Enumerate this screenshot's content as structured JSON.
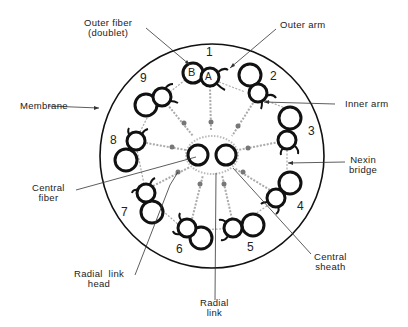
{
  "diagram": {
    "type": "axoneme-cross-section",
    "doublet_numbers": [
      "1",
      "2",
      "3",
      "4",
      "5",
      "6",
      "7",
      "8",
      "9"
    ],
    "subfiber_labels": {
      "a": "A",
      "b": "B"
    },
    "labels": {
      "outer_fiber": [
        "Outer fiber",
        "(doublet)"
      ],
      "outer_arm": "Outer arm",
      "membrane": "Membrane",
      "inner_arm": "Inner arm",
      "nexin_bridge": [
        "Nexin",
        "bridge"
      ],
      "central_fiber": [
        "Central",
        "fiber"
      ],
      "central_sheath": [
        "Central",
        "sheath"
      ],
      "radial_link_head": [
        "Radial  link",
        "head"
      ],
      "radial_link": [
        "Radial",
        "link"
      ]
    },
    "colors": {
      "ink": "#111111",
      "hatch": "#9a9a9a",
      "background": "#ffffff"
    }
  }
}
